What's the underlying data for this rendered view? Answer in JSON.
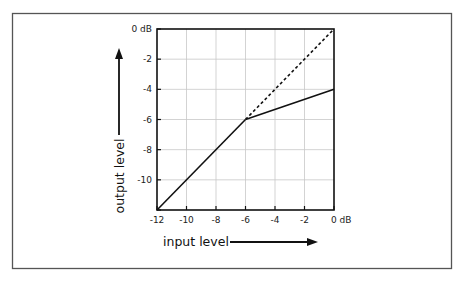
{
  "diagram": {
    "title": "",
    "frame_color": "#555555",
    "grid_color": "#c8c8c8",
    "line_color": "#111111"
  },
  "chart_data": {
    "type": "line",
    "title": "",
    "xlabel": "input level",
    "ylabel": "output level",
    "xlim": [
      -12,
      0
    ],
    "ylim": [
      -12,
      0
    ],
    "grid": true,
    "x_ticks": [
      -12,
      -10,
      -8,
      -6,
      -4,
      -2,
      0
    ],
    "y_ticks": [
      -12,
      -10,
      -8,
      -6,
      -4,
      -2,
      0
    ],
    "x_tick_labels": [
      "-12",
      "-10",
      "-8",
      "-6",
      "-4",
      "-2",
      "0 dB"
    ],
    "y_tick_labels": [
      "",
      "-10",
      "-8",
      "-6",
      "-4",
      "-2",
      "0 dB"
    ],
    "series": [
      {
        "name": "unity (below threshold)",
        "style": "solid",
        "x": [
          -12,
          -6
        ],
        "y": [
          -12,
          -6
        ]
      },
      {
        "name": "compressed (above threshold)",
        "style": "solid",
        "x": [
          -6,
          0
        ],
        "y": [
          -6,
          -4
        ]
      },
      {
        "name": "unity reference",
        "style": "dashed",
        "x": [
          -6,
          0
        ],
        "y": [
          -6,
          0
        ]
      }
    ]
  },
  "labels": {
    "x_axis_title": "input level",
    "y_axis_title": "output level"
  }
}
